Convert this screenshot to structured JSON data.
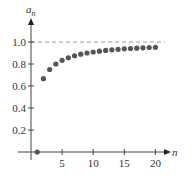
{
  "chart_data": {
    "type": "scatter",
    "title": "",
    "xlabel": "n",
    "ylabel": "a_n",
    "ylabel_display": {
      "base": "a",
      "subscript": "n"
    },
    "x": [
      1,
      2,
      3,
      4,
      5,
      6,
      7,
      8,
      9,
      10,
      11,
      12,
      13,
      14,
      15,
      16,
      17,
      18,
      19,
      20
    ],
    "values": [
      0,
      0.667,
      0.75,
      0.8,
      0.833,
      0.857,
      0.875,
      0.889,
      0.9,
      0.909,
      0.917,
      0.923,
      0.929,
      0.933,
      0.938,
      0.941,
      0.944,
      0.947,
      0.95,
      0.952
    ],
    "xticks": [
      5,
      10,
      15,
      20
    ],
    "xtick_labels": [
      "5",
      "10",
      "15",
      "20"
    ],
    "yticks": [
      0.2,
      0.4,
      0.6,
      0.8,
      1.0
    ],
    "ytick_labels": [
      "0.2",
      "0.4",
      "0.6",
      "0.8",
      "1.0"
    ],
    "xlim": [
      0,
      21
    ],
    "ylim": [
      0,
      1.05
    ],
    "reference_line": {
      "y": 1.0,
      "style": "dashed"
    },
    "grid": false,
    "legend": null,
    "colors": {
      "points": "#555555",
      "axes": "#444444",
      "reference": "#9a9a9a"
    }
  }
}
